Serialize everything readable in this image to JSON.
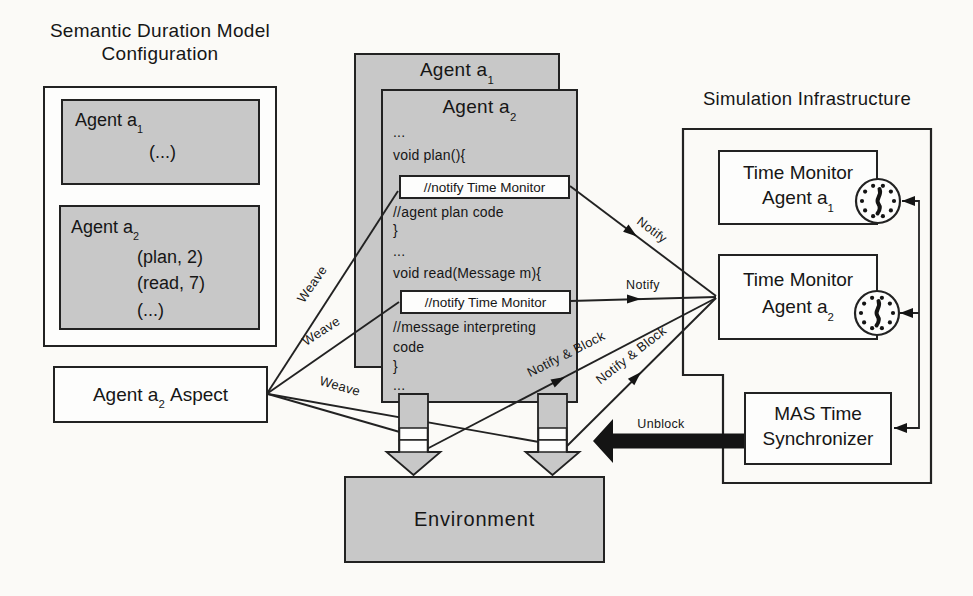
{
  "colors": {
    "page_background": "#fbfaf7",
    "diagram_gray_fill": "#c8c8c8",
    "outline_black": "#222222",
    "callout_white": "#fdfdfc",
    "solid_arrow_black": "#141414"
  },
  "config_panel": {
    "title_line1": "Semantic Duration Model",
    "title_line2": "Configuration",
    "agent1": {
      "label": "Agent a",
      "label_sub": "1",
      "items": [
        "(...)"
      ]
    },
    "agent2": {
      "label": "Agent a",
      "label_sub": "2",
      "items": [
        "(plan, 2)",
        "(read, 7)",
        "(...)"
      ]
    }
  },
  "aspect_box": {
    "label_pre": "Agent a",
    "label_sub": "2",
    "label_post": "Aspect"
  },
  "agent_stack": {
    "back_label": "Agent a",
    "back_sub": "1",
    "front_label": "Agent a",
    "front_sub": "2",
    "code": [
      "...",
      "void plan(){",
      "//agent plan code",
      "}",
      "...",
      "void read(Message m){",
      "//message interpreting",
      "code",
      "}",
      "..."
    ],
    "notify_callout_1": "//notify Time Monitor",
    "notify_callout_2": "//notify Time Monitor"
  },
  "environment": {
    "label": "Environment"
  },
  "sim_infrastructure": {
    "title": "Simulation Infrastructure",
    "tm1_line1": "Time Monitor",
    "tm1_line2": "Agent a",
    "tm1_sub": "1",
    "tm2_line1": "Time Monitor",
    "tm2_line2": "Agent a",
    "tm2_sub": "2",
    "mas_line1": "MAS Time",
    "mas_line2": "Synchronizer",
    "clock_icon": "analog-clock"
  },
  "edge_labels": {
    "weave1": "Weave",
    "weave2": "Weave",
    "weave3": "Weave",
    "notify1": "Notify",
    "notify2": "Notify",
    "notify_block1": "Notify & Block",
    "notify_block2": "Notify & Block",
    "unblock": "Unblock"
  }
}
